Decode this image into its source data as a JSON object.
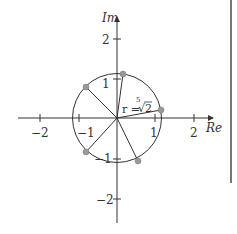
{
  "diagram": {
    "axes": {
      "x_label": "Re",
      "y_label": "Im",
      "x_ticks": [
        "−2",
        "−1",
        "1",
        "2"
      ],
      "y_ticks": [
        "2",
        "1",
        "−1",
        "−2"
      ]
    },
    "radius_label": {
      "prefix": "r = ",
      "index": "5",
      "radical": "√2"
    },
    "circle_radius": 1.1487,
    "roots": [
      {
        "angle_deg": 12,
        "re": 1.12,
        "im": 0.24
      },
      {
        "angle_deg": 84,
        "re": 0.12,
        "im": 1.14
      },
      {
        "angle_deg": 156,
        "re": -1.05,
        "im": 0.47
      },
      {
        "angle_deg": 228,
        "re": -0.77,
        "im": -0.85
      },
      {
        "angle_deg": 300,
        "re": 0.57,
        "im": -0.99
      }
    ],
    "colors": {
      "line": "#333333",
      "point": "#888888",
      "side_bar": "#777777"
    }
  }
}
